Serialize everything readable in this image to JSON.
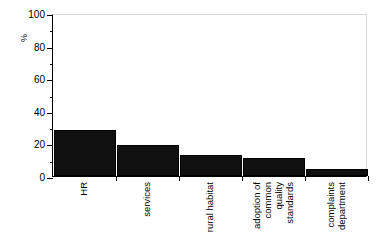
{
  "chart_data": {
    "type": "bar",
    "title": "",
    "subtitle": "",
    "xlabel": "",
    "ylabel": "%",
    "ylim": [
      0,
      100
    ],
    "grid": false,
    "legend": false,
    "categories": [
      "HR",
      "services",
      "rural habitat",
      "adoption of common quality standards",
      "complaints department"
    ],
    "category_lines": [
      [
        "HR"
      ],
      [
        "services"
      ],
      [
        "rural habitat"
      ],
      [
        "adoption of",
        "common",
        "quality",
        "standards"
      ],
      [
        "complaints",
        "department"
      ]
    ],
    "values": [
      28,
      19,
      13,
      11,
      4.5
    ],
    "ytick_labels": [
      "0",
      "20",
      "40",
      "60",
      "80",
      "100"
    ],
    "ytick_values": [
      0,
      20,
      40,
      60,
      80,
      100
    ],
    "yminor_values": [
      10,
      30,
      50,
      70,
      90
    ],
    "bar_color": "#101010",
    "axis_color": "#000000",
    "background_color": "#ffffff"
  }
}
